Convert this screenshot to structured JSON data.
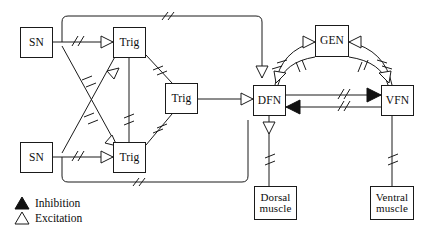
{
  "figure": {
    "type": "neural-circuit-diagram",
    "background_color": "#ffffff",
    "line_color": "#1a1a1a"
  },
  "nodes": [
    {
      "id": "sn_top",
      "label": "SN",
      "x": 20,
      "y": 27,
      "w": 33,
      "h": 31,
      "font_size": 11.5,
      "lines": 1
    },
    {
      "id": "sn_bottom",
      "label": "SN",
      "x": 20,
      "y": 142,
      "w": 33,
      "h": 31,
      "font_size": 11.5,
      "lines": 1
    },
    {
      "id": "trig_top",
      "label": "Trig",
      "x": 113,
      "y": 27,
      "w": 33,
      "h": 31,
      "font_size": 11.5,
      "lines": 1
    },
    {
      "id": "trig_bottom",
      "label": "Trig",
      "x": 113,
      "y": 142,
      "w": 33,
      "h": 31,
      "font_size": 11.5,
      "lines": 1
    },
    {
      "id": "trig_middle",
      "label": "Trig",
      "x": 165,
      "y": 83,
      "w": 33,
      "h": 31,
      "font_size": 11.5,
      "lines": 1
    },
    {
      "id": "dfn",
      "label": "DFN",
      "x": 253,
      "y": 85,
      "w": 33,
      "h": 31,
      "font_size": 11.5,
      "lines": 1
    },
    {
      "id": "gen",
      "label": "GEN",
      "x": 315,
      "y": 25,
      "w": 34,
      "h": 32,
      "font_size": 11.5,
      "lines": 1
    },
    {
      "id": "vfn",
      "label": "VFN",
      "x": 381,
      "y": 85,
      "w": 33,
      "h": 31,
      "font_size": 11.5,
      "lines": 1
    },
    {
      "id": "dorsal_muscle",
      "label": "Dorsal\nmuscle",
      "x": 254,
      "y": 186,
      "w": 43,
      "h": 34,
      "font_size": 11.0,
      "lines": 2
    },
    {
      "id": "ventral_muscle",
      "label": "Ventral\nmuscle",
      "x": 370,
      "y": 186,
      "w": 44,
      "h": 34,
      "font_size": 11.0,
      "lines": 2
    }
  ],
  "legend": {
    "items": [
      {
        "id": "inhibition",
        "label": "Inhibition",
        "marker": "filled-triangle-up",
        "fill": "#111111"
      },
      {
        "id": "excitation",
        "label": "Excitation",
        "marker": "outline-triangle-up",
        "fill": "#ffffff"
      }
    ]
  },
  "connections": [
    {
      "id": "sn-top-to-trig-top",
      "from": "sn_top",
      "to": "trig_top",
      "synapse": "excitation",
      "gap_marks": 1
    },
    {
      "id": "sn-top-to-trig-bottom",
      "from": "sn_top",
      "to": "trig_bottom",
      "synapse": "excitation",
      "gap_marks": 1
    },
    {
      "id": "sn-bottom-to-trig-bottom",
      "from": "sn_bottom",
      "to": "trig_bottom",
      "synapse": "excitation",
      "gap_marks": 1
    },
    {
      "id": "sn-bottom-to-trig-top",
      "from": "sn_bottom",
      "to": "trig_top",
      "synapse": "excitation",
      "gap_marks": 1
    },
    {
      "id": "sn-top-loop-to-dfn",
      "from": "sn_top",
      "to": "dfn",
      "synapse": "excitation",
      "gap_marks": 1
    },
    {
      "id": "sn-bottom-loop-to-dfn",
      "from": "sn_bottom",
      "to": "dfn",
      "synapse": "none",
      "gap_marks": 1
    },
    {
      "id": "trig-top-to-trig-bottom",
      "from": "trig_top",
      "to": "trig_bottom",
      "synapse": "none",
      "gap_marks": 1
    },
    {
      "id": "trig-top-to-trig-middle",
      "from": "trig_top",
      "to": "trig_middle",
      "synapse": "none",
      "gap_marks": 1
    },
    {
      "id": "trig-bottom-to-trig-middle",
      "from": "trig_bottom",
      "to": "trig_middle",
      "synapse": "none",
      "gap_marks": 1
    },
    {
      "id": "trig-middle-to-dfn",
      "from": "trig_middle",
      "to": "dfn",
      "synapse": "excitation",
      "gap_marks": 0
    },
    {
      "id": "dfn-to-gen",
      "from": "dfn",
      "to": "gen",
      "synapse": "excitation",
      "gap_marks": 1
    },
    {
      "id": "gen-to-dfn",
      "from": "gen",
      "to": "dfn",
      "synapse": "excitation",
      "gap_marks": 1
    },
    {
      "id": "vfn-to-gen",
      "from": "vfn",
      "to": "gen",
      "synapse": "excitation",
      "gap_marks": 1
    },
    {
      "id": "gen-to-vfn",
      "from": "gen",
      "to": "vfn",
      "synapse": "excitation",
      "gap_marks": 1
    },
    {
      "id": "dfn-to-vfn",
      "from": "dfn",
      "to": "vfn",
      "synapse": "inhibition",
      "gap_marks": 1
    },
    {
      "id": "vfn-to-dfn",
      "from": "vfn",
      "to": "dfn",
      "synapse": "inhibition",
      "gap_marks": 1
    },
    {
      "id": "dfn-to-dorsal-muscle",
      "from": "dfn",
      "to": "dorsal_muscle",
      "synapse": "excitation",
      "gap_marks": 1
    },
    {
      "id": "vfn-to-ventral-muscle",
      "from": "vfn",
      "to": "ventral_muscle",
      "synapse": "none",
      "gap_marks": 1
    }
  ]
}
